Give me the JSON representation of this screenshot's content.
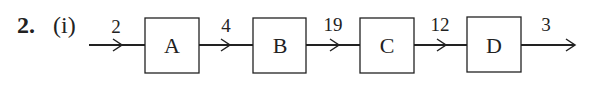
{
  "question": {
    "number": "2.",
    "part": "(i)"
  },
  "diagram": {
    "type": "flow-chain",
    "blocks": [
      {
        "label": "A"
      },
      {
        "label": "B"
      },
      {
        "label": "C"
      },
      {
        "label": "D"
      }
    ],
    "arrows": [
      {
        "label": "2"
      },
      {
        "label": "4"
      },
      {
        "label": "19"
      },
      {
        "label": "12"
      },
      {
        "label": "3"
      }
    ]
  }
}
